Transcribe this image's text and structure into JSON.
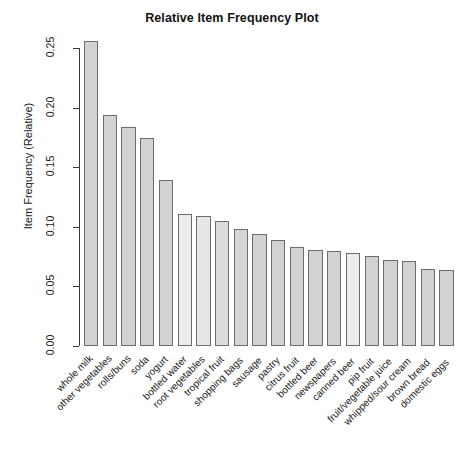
{
  "chart_data": {
    "type": "bar",
    "title": "Relative Item Frequency Plot",
    "xlabel": "",
    "ylabel": "Item Frequency (Relative)",
    "ylim": [
      0.0,
      0.25
    ],
    "grid": false,
    "legend": "none",
    "y_ticks": [
      "0.00",
      "0.05",
      "0.10",
      "0.15",
      "0.20",
      "0.25"
    ],
    "y_tick_values": [
      0.0,
      0.05,
      0.1,
      0.15,
      0.2,
      0.25
    ],
    "categories": [
      "whole milk",
      "other vegetables",
      "rolls/buns",
      "soda",
      "yogurt",
      "bottled water",
      "root vegetables",
      "tropical fruit",
      "shopping bags",
      "sausage",
      "pastry",
      "citrus fruit",
      "bottled beer",
      "newspapers",
      "canned beer",
      "pip fruit",
      "fruit/vegetable juice",
      "whipped/sour cream",
      "brown bread",
      "domestic eggs"
    ],
    "values": [
      0.2555,
      0.1935,
      0.1839,
      0.1743,
      0.1395,
      0.1105,
      0.1089,
      0.1049,
      0.0985,
      0.094,
      0.0889,
      0.0828,
      0.0805,
      0.0798,
      0.0777,
      0.0756,
      0.0723,
      0.0717,
      0.0648,
      0.0634
    ],
    "bar_fills": [
      "#d2d2d2",
      "#d2d2d2",
      "#d2d2d2",
      "#d2d2d2",
      "#d2d2d2",
      "#ececec",
      "#e6e6e6",
      "#dcdcdc",
      "#d6d6d6",
      "#d2d2d2",
      "#d2d2d2",
      "#d2d2d2",
      "#d2d2d2",
      "#d2d2d2",
      "#ececec",
      "#d2d2d2",
      "#d2d2d2",
      "#d2d2d2",
      "#d2d2d2",
      "#d2d2d2"
    ]
  },
  "style": {
    "axis_color": "#3a3a3a",
    "bar_border": "#6d6d6d",
    "text_color": "#1a1a1a",
    "background": "#ffffff"
  }
}
